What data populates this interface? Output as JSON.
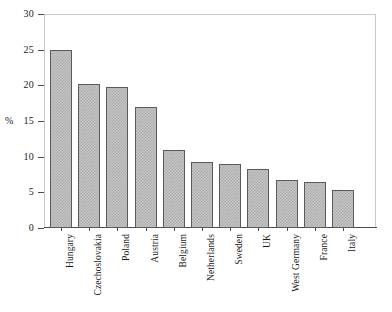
{
  "chart_data": {
    "type": "bar",
    "title": "",
    "subtitle": "",
    "xlabel": "",
    "ylabel": "%",
    "ylim": [
      0,
      30
    ],
    "yticks": [
      0,
      5,
      10,
      15,
      20,
      25,
      30
    ],
    "ytick_labels": [
      "0",
      "5",
      "10",
      "15",
      "20",
      "25",
      "30"
    ],
    "grid": false,
    "legend": false,
    "legend_position": "none",
    "categories": [
      "Hungary",
      "Czechoslovakia",
      "Poland",
      "Austria",
      "Belgium",
      "Netherlands",
      "Sweden",
      "UK",
      "West Germany",
      "France",
      "Italy"
    ],
    "values": [
      25.0,
      20.2,
      19.8,
      17.0,
      11.0,
      9.3,
      9.0,
      8.3,
      6.7,
      6.5,
      5.4
    ],
    "bar_fill_color": "#c4c4c4",
    "bar_edge_color": "#5a5a5a",
    "axis_color": "#4a4a4a",
    "frame_color": "#c9c9c9"
  }
}
